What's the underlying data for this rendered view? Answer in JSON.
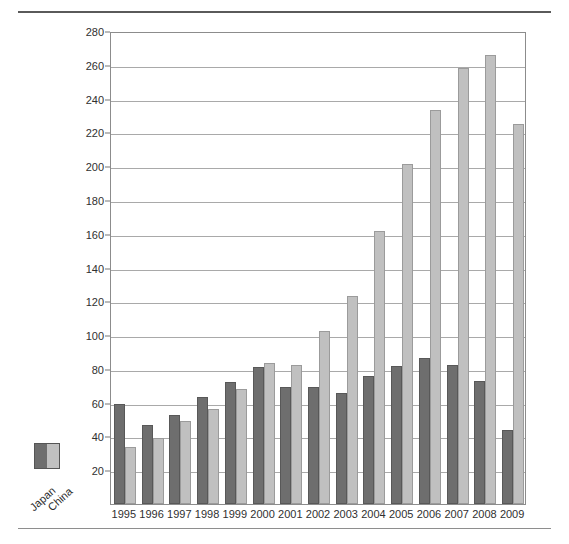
{
  "chart_data": {
    "type": "bar",
    "title": "",
    "subtitle": "",
    "xlabel": "",
    "ylabel": "In billions of dollars",
    "ylim": [
      0,
      280
    ],
    "ytick_step": 20,
    "yticks": [
      0,
      20,
      40,
      60,
      80,
      100,
      120,
      140,
      160,
      180,
      200,
      220,
      240,
      260,
      280
    ],
    "ytick_labels": [
      "",
      "20",
      "40",
      "60",
      "80",
      "100",
      "120",
      "140",
      "160",
      "180",
      "200",
      "220",
      "240",
      "260",
      "280"
    ],
    "grid": true,
    "legend_position": "lower-left-outside",
    "categories": [
      "1995",
      "1996",
      "1997",
      "1998",
      "1999",
      "2000",
      "2001",
      "2002",
      "2003",
      "2004",
      "2005",
      "2006",
      "2007",
      "2008",
      "2009"
    ],
    "series": [
      {
        "name": "Japan",
        "color": "#6e6e6e",
        "values": [
          59.5,
          47,
          52.5,
          63.5,
          72,
          81,
          69,
          69.5,
          65.5,
          75.5,
          81.5,
          86.5,
          82,
          73,
          44
        ]
      },
      {
        "name": "China",
        "color": "#c0c0c0",
        "values": [
          33.5,
          39,
          49,
          56.5,
          68,
          83.5,
          82,
          102.5,
          123,
          161.5,
          201,
          233,
          258,
          266,
          225
        ]
      }
    ]
  },
  "legend": {
    "items": [
      {
        "label": "Japan",
        "color": "#6e6e6e"
      },
      {
        "label": "China",
        "color": "#c0c0c0"
      }
    ]
  },
  "colors": {
    "japan": "#6e6e6e",
    "china": "#c0c0c0",
    "gridline": "#a9a9a9",
    "frame": "#8c8c8c",
    "rule": "#5a5a5a"
  }
}
